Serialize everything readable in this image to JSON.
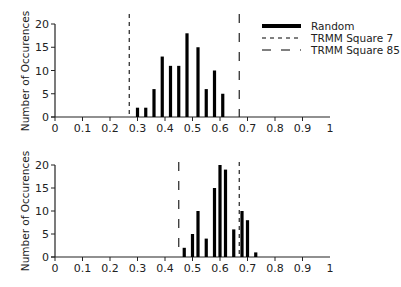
{
  "chart_data": [
    {
      "type": "bar",
      "panel": "top",
      "title": "",
      "xlabel": "",
      "ylabel": "Number of Occurences",
      "xlim": [
        0,
        1
      ],
      "ylim": [
        0,
        20
      ],
      "xticks": [
        "0",
        "0.1",
        "0.2",
        "0.3",
        "0.4",
        "0.5",
        "0.6",
        "0.7",
        "0.8",
        "0.9",
        "1"
      ],
      "yticks": [
        "0",
        "5",
        "10",
        "15",
        "20"
      ],
      "grid": false,
      "series": [
        {
          "name": "Random",
          "x": [
            0.3,
            0.33,
            0.36,
            0.39,
            0.42,
            0.45,
            0.48,
            0.52,
            0.55,
            0.58,
            0.61
          ],
          "values": [
            2,
            2,
            6,
            13,
            11,
            11,
            18,
            15,
            6,
            10,
            5
          ]
        }
      ],
      "reference_lines": [
        {
          "name": "TRMM Square 7",
          "x": 0.27,
          "style": "short-dash"
        },
        {
          "name": "TRMM Square 85",
          "x": 0.67,
          "style": "long-dash"
        }
      ],
      "legend": {
        "placement": "top-right",
        "entries": [
          {
            "label": "Random",
            "style": "solid-thick"
          },
          {
            "label": "TRMM Square 7",
            "style": "short-dash"
          },
          {
            "label": "TRMM Square 85",
            "style": "long-dash"
          }
        ]
      }
    },
    {
      "type": "bar",
      "panel": "bottom",
      "title": "",
      "xlabel": "",
      "ylabel": "Number of Occurences",
      "xlim": [
        0,
        1
      ],
      "ylim": [
        0,
        20
      ],
      "xticks": [
        "0",
        "0.1",
        "0.2",
        "0.3",
        "0.4",
        "0.5",
        "0.6",
        "0.7",
        "0.8",
        "0.9",
        "1"
      ],
      "yticks": [
        "0",
        "5",
        "10",
        "15",
        "20"
      ],
      "grid": false,
      "series": [
        {
          "name": "Random",
          "x": [
            0.47,
            0.5,
            0.52,
            0.55,
            0.58,
            0.6,
            0.62,
            0.65,
            0.68,
            0.7,
            0.73
          ],
          "values": [
            2,
            5,
            10,
            4,
            15,
            20,
            19,
            6,
            10,
            8,
            1
          ]
        }
      ],
      "reference_lines": [
        {
          "name": "TRMM Square 85",
          "x": 0.45,
          "style": "long-dash"
        },
        {
          "name": "TRMM Square 7",
          "x": 0.67,
          "style": "short-dash"
        }
      ]
    }
  ]
}
